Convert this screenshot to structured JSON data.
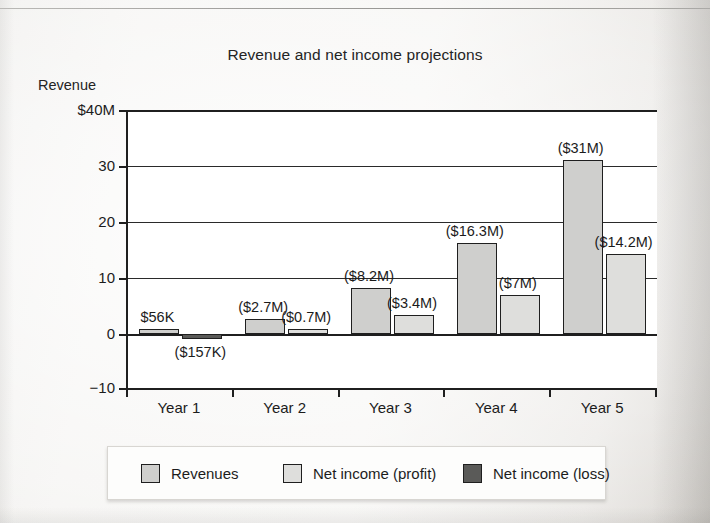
{
  "chart_data": {
    "type": "bar",
    "title": "Revenue and net income projections",
    "xlabel": "",
    "ylabel": "Revenue",
    "y_axis_unit_label": "$40M",
    "ylim": [
      -10,
      40
    ],
    "yticks": [
      40,
      30,
      20,
      10,
      0,
      -10
    ],
    "ytick_labels": [
      "$40M",
      "30",
      "20",
      "10",
      "0",
      "-10"
    ],
    "grid": true,
    "legend_position": "bottom",
    "categories": [
      "Year 1",
      "Year 2",
      "Year 3",
      "Year 4",
      "Year 5"
    ],
    "series": [
      {
        "name": "Revenues",
        "color": "#cfcfcd",
        "values": [
          0.056,
          2.7,
          8.2,
          16.3,
          31
        ],
        "labels": [
          "$56K",
          "($2.7M)",
          "($8.2M)",
          "($16.3M)",
          "($31M)"
        ]
      },
      {
        "name": "Net income",
        "color": "#dededc",
        "values": [
          -0.157,
          0.7,
          3.4,
          7,
          14.2
        ],
        "labels": [
          "($157K)",
          "($0.7M)",
          "($3.4M)",
          "($7M)",
          "($14.2M)"
        ],
        "value_kinds": [
          "loss",
          "profit",
          "profit",
          "profit",
          "profit"
        ]
      }
    ],
    "legend": [
      {
        "label": "Revenues",
        "swatch": "revenue"
      },
      {
        "label": "Net income (profit)",
        "swatch": "profit"
      },
      {
        "label": "Net income (loss)",
        "swatch": "loss"
      }
    ],
    "colors": {
      "revenue": "#cfcfcd",
      "profit": "#dededc",
      "loss": "#5a5a58",
      "axis": "#1f1f1f",
      "plot_background": "#ffffff",
      "page_background": "#f2f1ef"
    }
  }
}
